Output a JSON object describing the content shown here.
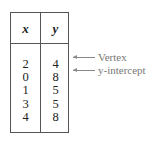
{
  "table": {
    "headers": [
      "x",
      "y"
    ],
    "rows": [
      {
        "x": "2",
        "y": "4"
      },
      {
        "x": "0",
        "y": "8"
      },
      {
        "x": "1",
        "y": "5"
      },
      {
        "x": "3",
        "y": "5"
      },
      {
        "x": "4",
        "y": "8"
      }
    ]
  },
  "annotations": [
    {
      "row": 0,
      "label": "Vertex"
    },
    {
      "row": 1,
      "label": "y-intercept"
    }
  ]
}
